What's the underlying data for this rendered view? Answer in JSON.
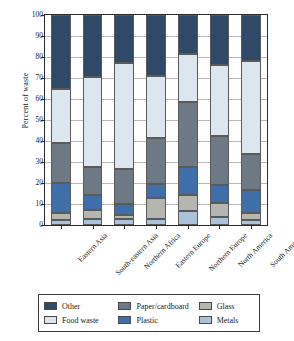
{
  "chart_data": {
    "type": "bar",
    "title": "",
    "subtitle": "",
    "xlabel": "",
    "ylabel": "Percent of waste",
    "ylim": [
      0,
      100
    ],
    "yticks": [
      0,
      10,
      20,
      30,
      40,
      50,
      60,
      70,
      80,
      90,
      100
    ],
    "grid": true,
    "stacked": true,
    "stack_order_bottom_to_top": [
      "Metals",
      "Glass",
      "Plastic",
      "Paper/cardboard",
      "Food waste",
      "Other"
    ],
    "legend_position": "below",
    "categories": [
      "Eastern Asia",
      "South-eastern Asia",
      "Northern Africa",
      "Eastern Europe",
      "Northern Europe",
      "North America",
      "South America"
    ],
    "series": [
      {
        "name": "Metals",
        "color": "#aac2dc",
        "values": [
          2.5,
          3.0,
          3.0,
          3.0,
          6.5,
          4.0,
          2.5
        ]
      },
      {
        "name": "Glass",
        "color": "#b6b6b0",
        "values": [
          3.0,
          4.0,
          2.0,
          10.0,
          8.0,
          6.5,
          3.0
        ]
      },
      {
        "name": "Plastic",
        "color": "#3f6fa8",
        "values": [
          14.5,
          7.5,
          5.0,
          6.5,
          13.0,
          8.5,
          11.0
        ]
      },
      {
        "name": "Paper/cardboard",
        "color": "#6d7a85",
        "values": [
          19.0,
          13.0,
          16.5,
          22.0,
          31.0,
          23.5,
          17.5
        ]
      },
      {
        "name": "Food waste",
        "color": "#dce6ef",
        "values": [
          26.0,
          43.0,
          50.5,
          29.5,
          23.0,
          33.5,
          44.0
        ]
      },
      {
        "name": "Other",
        "color": "#2f4a68",
        "values": [
          35.0,
          29.5,
          23.0,
          29.0,
          18.5,
          24.0,
          22.0
        ]
      }
    ],
    "cumulative_tops": {
      "Eastern Asia": [
        2.5,
        5.5,
        20.0,
        39.0,
        65.0,
        100
      ],
      "South-eastern Asia": [
        3.0,
        7.0,
        14.5,
        27.5,
        70.5,
        100
      ],
      "Northern Africa": [
        3.0,
        5.0,
        10.0,
        26.5,
        77.0,
        100
      ],
      "Eastern Europe": [
        3.0,
        13.0,
        19.5,
        41.5,
        71.0,
        100
      ],
      "Northern Europe": [
        6.5,
        14.5,
        27.5,
        58.5,
        81.5,
        100
      ],
      "North America": [
        4.0,
        10.5,
        19.0,
        42.5,
        76.0,
        100
      ],
      "South America": [
        2.5,
        5.5,
        16.5,
        34.0,
        78.0,
        100
      ]
    }
  },
  "legend": {
    "items": [
      {
        "label": "Other",
        "color": "#2f4a68"
      },
      {
        "label": "Paper/cardboard",
        "color": "#6d7a85"
      },
      {
        "label": "Glass",
        "color": "#b6b6b0"
      },
      {
        "label": "Food waste",
        "color": "#dce6ef"
      },
      {
        "label": "Plastic",
        "color": "#3f6fa8"
      },
      {
        "label": "Metals",
        "color": "#aac2dc"
      }
    ]
  },
  "axis": {
    "y_title": "Percent of waste"
  }
}
